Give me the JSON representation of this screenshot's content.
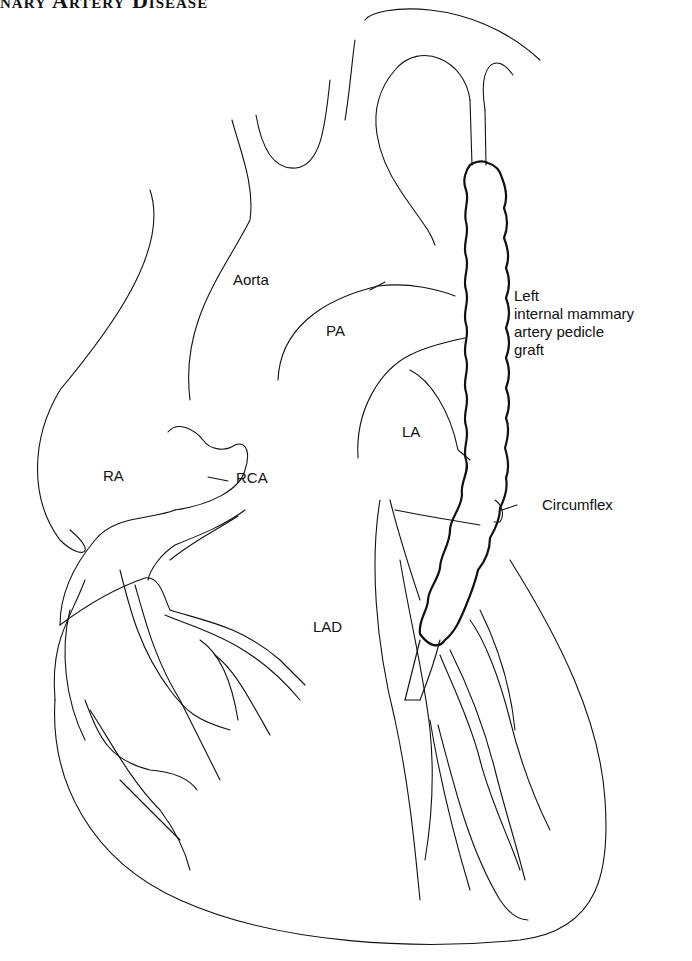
{
  "header": {
    "text": "nary Artery Disease"
  },
  "diagram": {
    "type": "anatomical illustration",
    "labels": {
      "aorta": "Aorta",
      "pa": "PA",
      "ra": "RA",
      "la": "LA",
      "rca": "RCA",
      "lad": "LAD",
      "circumflex": "Circumflex",
      "graft": [
        "Left",
        "internal mammary",
        "artery pedicle",
        "graft"
      ]
    }
  }
}
